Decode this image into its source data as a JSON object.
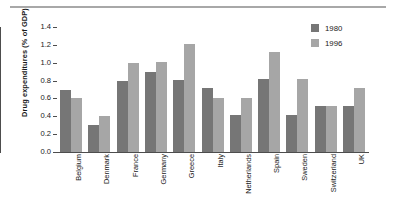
{
  "chart_data": {
    "type": "bar",
    "title": "",
    "xlabel": "",
    "ylabel": "Drug expenditures (% of GDP)",
    "ylim": [
      0.0,
      1.4
    ],
    "yticks": [
      "0.0",
      "0.2",
      "0.4",
      "0.6",
      "0.8",
      "1.0",
      "1.2",
      "1.4"
    ],
    "grid": false,
    "legend_position": "top-right",
    "categories": [
      "Belgium",
      "Denmark",
      "France",
      "Germany",
      "Greece",
      "Italy",
      "Netherlands",
      "Spain",
      "Sweden",
      "Switzerland",
      "UK"
    ],
    "series": [
      {
        "name": "1980",
        "color": "#767676",
        "values": [
          0.7,
          0.3,
          0.8,
          0.9,
          0.81,
          0.72,
          0.41,
          0.82,
          0.41,
          0.52,
          0.52
        ]
      },
      {
        "name": "1996",
        "color": "#a6a6a6",
        "values": [
          0.6,
          0.4,
          1.0,
          1.01,
          1.21,
          0.61,
          0.61,
          1.12,
          0.82,
          0.52,
          0.72
        ]
      }
    ]
  },
  "legend": {
    "items": [
      {
        "label": "1980"
      },
      {
        "label": "1996"
      }
    ]
  }
}
